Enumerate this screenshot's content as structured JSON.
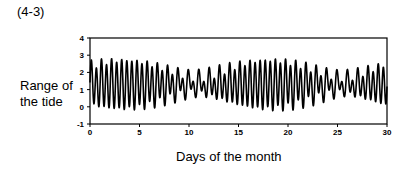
{
  "figure": {
    "label": "(4-3)",
    "ylabel_line1": "Range of",
    "ylabel_line2": "the tide",
    "xlabel": "Days of the month"
  },
  "chart_data": {
    "type": "line",
    "title": "(4-3)",
    "xlabel": "Days of the month",
    "ylabel": "Range of the tide",
    "xlim": [
      0,
      30
    ],
    "ylim": [
      -1,
      4
    ],
    "xticks": [
      0,
      5,
      10,
      15,
      20,
      25,
      30
    ],
    "yticks": [
      -1,
      0,
      1,
      2,
      3,
      4
    ],
    "grid": false,
    "legend": null,
    "line_color": "#000000",
    "model": {
      "mean": 1.3,
      "components": [
        {
          "name": "M2",
          "amp": 0.95,
          "period_days": 0.5175,
          "phase": 1.2
        },
        {
          "name": "S2",
          "amp": 0.45,
          "period_days": 0.5,
          "phase": 2.6
        },
        {
          "name": "K1",
          "amp": 0.25,
          "period_days": 0.9973,
          "phase": 0.4
        },
        {
          "name": "O1",
          "amp": 0.18,
          "period_days": 1.0758,
          "phase": 2.0
        }
      ],
      "samples_per_day": 48
    },
    "envelope_samples": {
      "x": [
        0,
        2,
        4,
        6,
        8,
        10,
        12,
        14,
        16,
        18,
        20,
        22,
        24,
        26,
        28,
        30
      ],
      "high": [
        2.6,
        2.3,
        2.5,
        2.8,
        2.9,
        2.8,
        2.7,
        2.5,
        2.2,
        2.0,
        2.2,
        2.4,
        2.6,
        2.6,
        2.4,
        2.3
      ],
      "low": [
        0.7,
        1.2,
        1.0,
        0.3,
        -0.4,
        -0.3,
        -0.1,
        0.2,
        0.6,
        0.9,
        0.6,
        0.4,
        0.2,
        0.3,
        0.3,
        0.2
      ]
    }
  }
}
